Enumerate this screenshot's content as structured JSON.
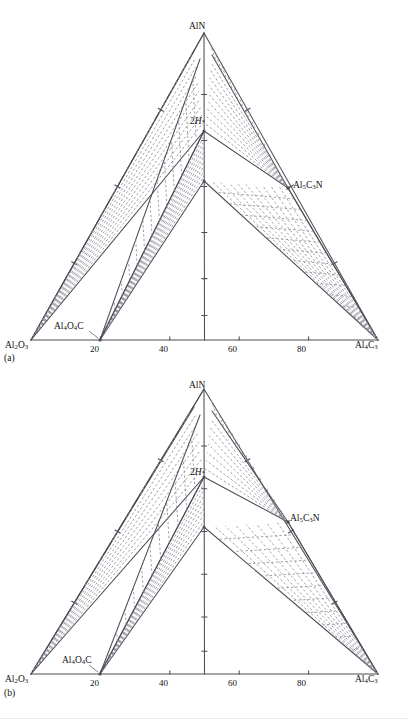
{
  "figure": {
    "panels": [
      {
        "caption": "(a)",
        "apex_label": "AlN",
        "left_corner_label": "Al2O3",
        "right_corner_label": "Al4C3",
        "baseline_ticks": [
          "20",
          "40",
          "60",
          "80"
        ],
        "compound_left": "Al4O4C",
        "compound_right": "Al5C3N",
        "phase_label_main": "2",
        "phase_label_italic": "H",
        "phase_label_sup": "*"
      },
      {
        "caption": "(b)",
        "apex_label": "AlN",
        "left_corner_label": "Al2O3",
        "right_corner_label": "Al4C3",
        "baseline_ticks": [
          "20",
          "40",
          "60",
          "80"
        ],
        "compound_left": "Al4O4C",
        "compound_right": "Al5C3N",
        "phase_label_main": "2",
        "phase_label_italic": "H",
        "phase_label_sup": "*"
      }
    ]
  },
  "chart_data": {
    "type": "line",
    "xlabel": "",
    "ylabel": "",
    "xlim": [
      0,
      100
    ],
    "grid": false,
    "legend": null,
    "axis_tick_labels": [
      "20",
      "40",
      "60",
      "80"
    ],
    "axis_tick_values": [
      20,
      40,
      60,
      80
    ],
    "corner_labels": {
      "apex": "AlN",
      "bottom_left": "Al2O3",
      "bottom_right": "Al4C3"
    },
    "annotations": [
      {
        "text": "Al4O4C",
        "x": 20,
        "edge": "bottom"
      },
      {
        "text": "Al5C3N",
        "x": 75,
        "edge": "right"
      },
      {
        "text": "2H*",
        "x": 50,
        "edge": "interior"
      }
    ],
    "panels": [
      {
        "name": "(a)",
        "vertical_nodes_fraction": [
          0.0,
          0.36,
          0.55,
          1.0
        ],
        "tie_line_count_left_wedge": 14,
        "tie_line_count_right_wedge": 14,
        "tie_line_count_center_left": 10,
        "tie_line_count_center_right": 10,
        "style": "dashed tie-lines inside two-phase wedges, solid phase boundaries"
      },
      {
        "name": "(b)",
        "vertical_nodes_fraction": [
          0.0,
          0.36,
          0.55,
          1.0
        ],
        "tie_line_count_left_wedge": 12,
        "tie_line_count_right_wedge": 12,
        "tie_line_count_center_left": 8,
        "tie_line_count_center_right": 8,
        "style": "dashed tie-lines inside two-phase wedges, solid phase boundaries"
      }
    ]
  },
  "colors": {
    "line": "#4d4d57",
    "dash": "#8f8f99",
    "text": "#111111",
    "background": "#ffffff"
  }
}
